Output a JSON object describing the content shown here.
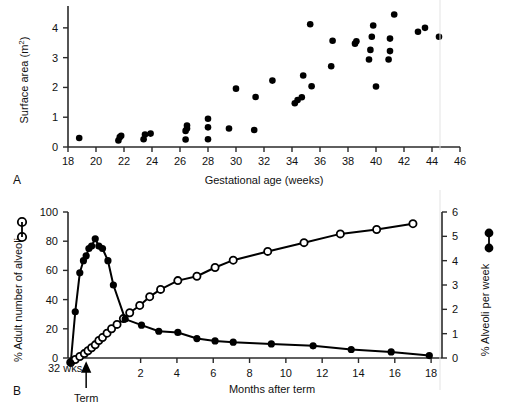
{
  "figure": {
    "background": "#ffffff",
    "marker_color": "#000000"
  },
  "chart_data": [
    {
      "id": "panel-a",
      "type": "scatter",
      "panel_letter": "A",
      "title": "",
      "xlabel": "Gestational age (weeks)",
      "ylabel": "Surface area (m2)",
      "ylabel_display": "Surface area (m²)",
      "xlim": [
        18,
        46
      ],
      "ylim": [
        0,
        4.6
      ],
      "xticks": [
        18,
        20,
        22,
        24,
        26,
        28,
        30,
        32,
        34,
        36,
        38,
        40,
        42,
        44,
        46
      ],
      "yticks": [
        0,
        1,
        2,
        3,
        4
      ],
      "grid": false,
      "legend": "none",
      "marker": "filled-circle",
      "points": [
        [
          18.8,
          0.3
        ],
        [
          21.6,
          0.22
        ],
        [
          21.7,
          0.33
        ],
        [
          21.8,
          0.38
        ],
        [
          23.4,
          0.26
        ],
        [
          23.5,
          0.42
        ],
        [
          23.9,
          0.45
        ],
        [
          26.4,
          0.25
        ],
        [
          26.4,
          0.54
        ],
        [
          26.5,
          0.62
        ],
        [
          26.5,
          0.72
        ],
        [
          28.0,
          0.26
        ],
        [
          28.0,
          0.66
        ],
        [
          28.0,
          0.95
        ],
        [
          29.5,
          0.62
        ],
        [
          30.0,
          1.96
        ],
        [
          31.3,
          0.57
        ],
        [
          31.4,
          1.68
        ],
        [
          32.6,
          2.23
        ],
        [
          34.2,
          1.47
        ],
        [
          34.4,
          1.58
        ],
        [
          34.7,
          1.67
        ],
        [
          34.8,
          2.4
        ],
        [
          35.3,
          4.12
        ],
        [
          35.4,
          2.04
        ],
        [
          36.8,
          2.71
        ],
        [
          36.9,
          3.57
        ],
        [
          38.5,
          3.47
        ],
        [
          38.6,
          3.55
        ],
        [
          39.5,
          2.94
        ],
        [
          39.6,
          3.26
        ],
        [
          39.7,
          3.7
        ],
        [
          39.8,
          4.08
        ],
        [
          40.0,
          2.03
        ],
        [
          40.9,
          2.94
        ],
        [
          41.0,
          3.22
        ],
        [
          41.0,
          3.64
        ],
        [
          41.3,
          4.45
        ],
        [
          43.0,
          3.87
        ],
        [
          43.5,
          4.0
        ],
        [
          44.5,
          3.7
        ]
      ]
    },
    {
      "id": "panel-b",
      "type": "line",
      "panel_letter": "B",
      "title": "",
      "xlabel": "Months after term",
      "x_origin_label": "32 wks",
      "term_label": "Term",
      "term_x": -1.0,
      "ylabel_left": "% Adult number of alveoli",
      "ylabel_right": "% Alveoli per week",
      "xlim": [
        -2.0,
        18.6
      ],
      "ylim_left": [
        0,
        100
      ],
      "ylim_right": [
        0,
        6
      ],
      "xticks": [
        2,
        4,
        6,
        8,
        10,
        12,
        14,
        16,
        18
      ],
      "yticks_left": [
        0,
        20,
        40,
        60,
        80,
        100
      ],
      "yticks_right": [
        0,
        1,
        2,
        3,
        4,
        5,
        6
      ],
      "grid": false,
      "legend_position": "axis-labels",
      "series": [
        {
          "name": "% Adult number of alveoli",
          "axis": "left",
          "marker": "open-circle",
          "x": [
            -1.85,
            -1.6,
            -1.35,
            -1.1,
            -0.9,
            -0.7,
            -0.5,
            -0.3,
            -0.1,
            0.15,
            0.4,
            0.7,
            1.05,
            1.4,
            1.95,
            2.5,
            3.1,
            4.05,
            5.1,
            6.1,
            7.1,
            9.0,
            11.0,
            13.0,
            15.0,
            17.0
          ],
          "values": [
            -3,
            -1,
            1,
            3,
            5,
            7,
            9,
            12,
            14,
            17,
            20,
            23,
            27,
            31,
            36,
            42,
            47,
            53,
            56,
            62,
            67,
            73,
            79,
            85,
            88,
            92
          ]
        },
        {
          "name": "% Alveoli per week",
          "axis": "right",
          "marker": "filled-circle",
          "x": [
            -1.85,
            -1.6,
            -1.35,
            -1.15,
            -1.0,
            -0.85,
            -0.7,
            -0.5,
            -0.3,
            -0.1,
            0.2,
            0.5,
            1.15,
            2.05,
            3.0,
            4.05,
            5.1,
            6.1,
            7.1,
            9.2,
            11.5,
            13.6,
            15.8,
            17.9
          ],
          "values": [
            -0.2,
            1.9,
            3.5,
            4.0,
            4.2,
            4.5,
            4.6,
            4.9,
            4.6,
            4.5,
            4.0,
            3.0,
            1.6,
            1.35,
            1.1,
            1.05,
            0.8,
            0.7,
            0.65,
            0.58,
            0.5,
            0.35,
            0.25,
            0.1
          ]
        }
      ]
    }
  ]
}
